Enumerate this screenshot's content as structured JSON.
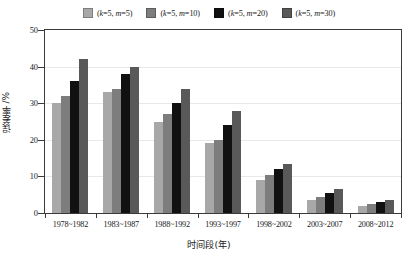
{
  "chart_data": {
    "type": "bar",
    "title": "",
    "xlabel": "时间段(年)",
    "ylabel": "误差率 /%",
    "ylim": [
      0,
      50
    ],
    "yticks": [
      0,
      10,
      20,
      30,
      40,
      50
    ],
    "grid": true,
    "legend_position": "top-center",
    "categories": [
      "1978~1982",
      "1983~1987",
      "1988~1992",
      "1993~1997",
      "1998~2002",
      "2003~2007",
      "2008~2012"
    ],
    "series": [
      {
        "name": "(k=5, m=5)",
        "color": "#a8a8a8",
        "values": [
          30,
          33,
          25,
          19,
          9,
          3.5,
          2
        ]
      },
      {
        "name": "(k=5, m=10)",
        "color": "#7d7d7d",
        "values": [
          32,
          34,
          27,
          20,
          10.5,
          4.5,
          2.5
        ]
      },
      {
        "name": "(k=5, m=20)",
        "color": "#111111",
        "values": [
          36,
          38,
          30,
          24,
          12,
          5.5,
          3
        ]
      },
      {
        "name": "(k=5, m=30)",
        "color": "#595959",
        "values": [
          42,
          40,
          34,
          28,
          13.5,
          6.5,
          3.5
        ]
      }
    ]
  },
  "legend": {
    "items": [
      {
        "label": "(k=5, m=5)",
        "color": "#a8a8a8"
      },
      {
        "label": "(k=5, m=10)",
        "color": "#7d7d7d"
      },
      {
        "label": "(k=5, m=20)",
        "color": "#111111"
      },
      {
        "label": "(k=5, m=30)",
        "color": "#595959"
      }
    ]
  },
  "axes": {
    "y_title": "误差率 /%",
    "x_title": "时间段(年)",
    "y_tick_labels": [
      "50",
      "40",
      "30",
      "20",
      "10",
      "0"
    ]
  }
}
